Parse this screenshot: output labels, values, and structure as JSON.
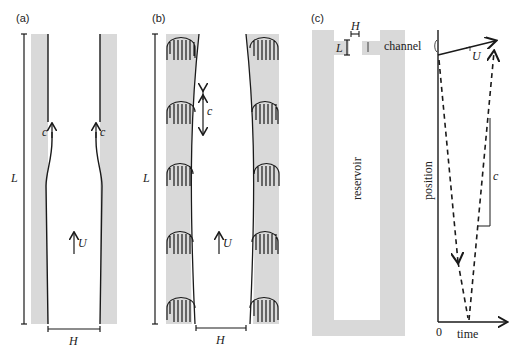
{
  "panels": {
    "a": {
      "label": "(a)",
      "length_label": "L",
      "width_label": "H",
      "wave_label_left": "c",
      "wave_label_right": "c",
      "flow_label": "U"
    },
    "b": {
      "label": "(b)",
      "length_label": "L",
      "width_label": "H",
      "wave_label": "c",
      "flow_label": "U"
    },
    "c": {
      "label": "(c)",
      "channel_width_label": "H",
      "channel_length_label": "L",
      "channel_label": "channel",
      "reservoir_label": "reservoir",
      "plot": {
        "ylabel": "position",
        "xlabel": "time",
        "origin_label": "0",
        "flow_label": "U",
        "wave_label": "c"
      }
    }
  },
  "colors": {
    "wall": "#d9d9d9",
    "line": "#1a1a1a"
  }
}
